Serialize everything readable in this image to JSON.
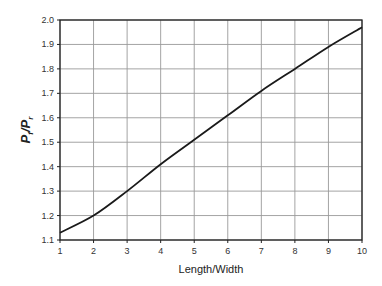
{
  "chart_data": {
    "type": "line",
    "title": "",
    "xlabel": "Length/Width",
    "ylabel": "Pf/Pr",
    "ylabel_parts": {
      "main1": "P",
      "sub1": "f",
      "slash": "/",
      "main2": "P",
      "sub2": "r"
    },
    "x": [
      1,
      2,
      3,
      4,
      5,
      6,
      7,
      8,
      9,
      10
    ],
    "series": [
      {
        "name": "Pf/Pr",
        "values": [
          1.13,
          1.2,
          1.3,
          1.41,
          1.51,
          1.61,
          1.71,
          1.8,
          1.89,
          1.97
        ]
      }
    ],
    "xlim": [
      1,
      10
    ],
    "ylim": [
      1.1,
      2.0
    ],
    "xticks": [
      "1",
      "2",
      "3",
      "4",
      "5",
      "6",
      "7",
      "8",
      "9",
      "10"
    ],
    "yticks": [
      "1.1",
      "1.2",
      "1.3",
      "1.4",
      "1.5",
      "1.6",
      "1.7",
      "1.8",
      "1.9",
      "2.0"
    ],
    "grid": true,
    "legend": "none",
    "line_color": "#1a1a1a",
    "grid_color": "#9a9a9a"
  }
}
